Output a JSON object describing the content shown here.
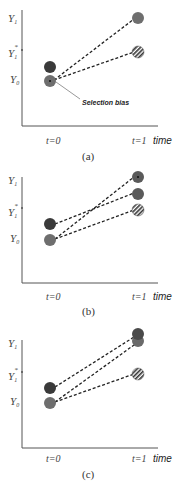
{
  "colors": {
    "dark_circle": "#3a3a3a",
    "gray_circle": "#6e6e6e",
    "axis": "#555555",
    "dash": "#222222",
    "arrow": "#999999"
  },
  "panels": [
    {
      "id": "a",
      "caption": "(a)",
      "y_labels": {
        "y1": "Y",
        "y1_sub": "1",
        "y1star": "Y",
        "y1star_sub": "1",
        "y1star_sup": "*",
        "y0": "Y",
        "y0_sub": "0"
      },
      "x_labels": {
        "t0": "t=0",
        "t1": "t=1",
        "time": "time"
      },
      "annotation": "Selection bias"
    },
    {
      "id": "b",
      "caption": "(b)",
      "y_labels": {
        "y1": "Y",
        "y1_sub": "1",
        "y1star": "Y",
        "y1star_sub": "1",
        "y1star_sup": "*",
        "y0": "Y",
        "y0_sub": "0"
      },
      "x_labels": {
        "t0": "t=0",
        "t1": "t=1",
        "time": "time"
      }
    },
    {
      "id": "c",
      "caption": "(c)",
      "y_labels": {
        "y1": "Y",
        "y1_sub": "1",
        "y1star": "Y",
        "y1star_sub": "1",
        "y1star_sup": "*",
        "y0": "Y",
        "y0_sub": "0"
      },
      "x_labels": {
        "t0": "t=0",
        "t1": "t=1",
        "time": "time"
      }
    }
  ]
}
